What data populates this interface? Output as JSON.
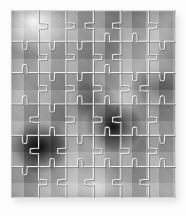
{
  "image": {
    "title": "Jigsaw puzzle",
    "subject": "grayscale jigsaw puzzle assembled from interlocking pieces",
    "width": 186,
    "height": 216,
    "background_color": "#fdfdfd",
    "shadow_color": "#c9c9c9"
  },
  "puzzle": {
    "name": "jigsaw-puzzle",
    "columns": 6,
    "rows": 6,
    "total_pieces": 36,
    "left": 11,
    "top": 10,
    "width": 165,
    "height": 188,
    "cell_width": 27.5,
    "cell_height": 31.3,
    "cut_line_color": "#f2f2f2",
    "cut_line_width": 1.1,
    "piece_edge_shadow": "#5a5a5a",
    "palette": {
      "lightest": "#f2f2f2",
      "light": "#c8c8c8",
      "mid": "#9a9a9a",
      "dark": "#585858",
      "darkest": "#161616"
    },
    "tone_grid": [
      [
        "mid",
        "light",
        "light",
        "mid",
        "dark",
        "mid"
      ],
      [
        "mid",
        "mid",
        "light",
        "mid",
        "dark",
        "light"
      ],
      [
        "dark",
        "light",
        "mid",
        "dark",
        "mid",
        "mid"
      ],
      [
        "dark",
        "light",
        "mid",
        "darkest",
        "dark",
        "light"
      ],
      [
        "darkest",
        "dark",
        "light",
        "dark",
        "mid",
        "mid"
      ],
      [
        "light",
        "mid",
        "light",
        "light",
        "light",
        "light"
      ]
    ],
    "highlight_regions": [
      {
        "name": "top-left-highlight",
        "x_pct": 14,
        "y_pct": 6,
        "tone": "lightest"
      },
      {
        "name": "bottom-center-highlight",
        "x_pct": 52,
        "y_pct": 94,
        "tone": "light"
      }
    ],
    "shadow_regions": [
      {
        "name": "left-dark-blob",
        "x_pct": 17,
        "y_pct": 73,
        "tone": "darkest"
      },
      {
        "name": "center-dark-blob",
        "x_pct": 62,
        "y_pct": 62,
        "tone": "darkest"
      },
      {
        "name": "right-mid-shade",
        "x_pct": 88,
        "y_pct": 42,
        "tone": "dark"
      }
    ]
  }
}
